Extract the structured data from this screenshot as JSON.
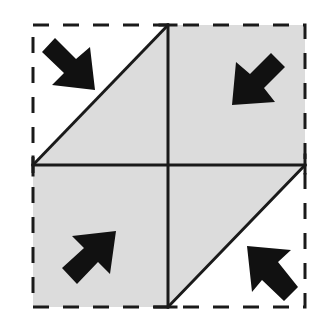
{
  "diagram": {
    "title": "",
    "colors": {
      "background": "#ffffff",
      "shaded_fill": "#dcdcdc",
      "line": "#1a1a1a",
      "arrow": "#111111"
    },
    "outer_square": {
      "x1": 33,
      "y1": 25,
      "x2": 305,
      "y2": 307,
      "style": "dashed"
    },
    "center": {
      "x": 168,
      "y": 165
    },
    "arrows": [
      {
        "id": "top-left",
        "direction": "down-right"
      },
      {
        "id": "top-right",
        "direction": "down-left"
      },
      {
        "id": "bottom-left",
        "direction": "up-right"
      },
      {
        "id": "bottom-right",
        "direction": "up-left"
      }
    ]
  }
}
